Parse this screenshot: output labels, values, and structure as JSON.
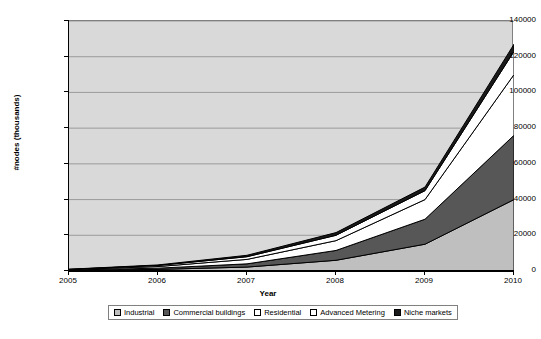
{
  "chart_data": {
    "type": "area",
    "stacked": true,
    "title": "",
    "xlabel": "Year",
    "ylabel": "#nodes (thousands)",
    "categories": [
      "2005",
      "2006",
      "2007",
      "2008",
      "2009",
      "2010"
    ],
    "x": [
      2005,
      2006,
      2007,
      2008,
      2009,
      2010
    ],
    "xlim": [
      2005,
      2010
    ],
    "ylim": [
      0,
      140000
    ],
    "ytick_labels": [
      "0",
      "20000",
      "40000",
      "60000",
      "80000",
      "100000",
      "120000",
      "140000"
    ],
    "ytick_values": [
      0,
      20000,
      40000,
      60000,
      80000,
      100000,
      120000,
      140000
    ],
    "grid": true,
    "legend_position": "bottom",
    "plot_background": "#d9d9d9",
    "series": [
      {
        "name": "Industrial",
        "color": "#bfbfbf",
        "values": [
          300,
          900,
          2200,
          6000,
          15000,
          40000
        ]
      },
      {
        "name": "Commercial buildings",
        "color": "#575757",
        "values": [
          200,
          700,
          1800,
          5500,
          14000,
          36000
        ]
      },
      {
        "name": "Residential",
        "color": "#ffffff",
        "values": [
          200,
          900,
          2500,
          5500,
          11000,
          34000
        ]
      },
      {
        "name": "Advanced Metering",
        "color": "#ffffff",
        "values": [
          200,
          600,
          1500,
          3000,
          5000,
          13000
        ]
      },
      {
        "name": "Niche markets",
        "color": "#1a1a1a",
        "values": [
          100,
          300,
          800,
          1500,
          2000,
          4000
        ]
      }
    ],
    "cumulative_totals": [
      1000,
      3400,
      8800,
      21500,
      47000,
      127000
    ]
  }
}
